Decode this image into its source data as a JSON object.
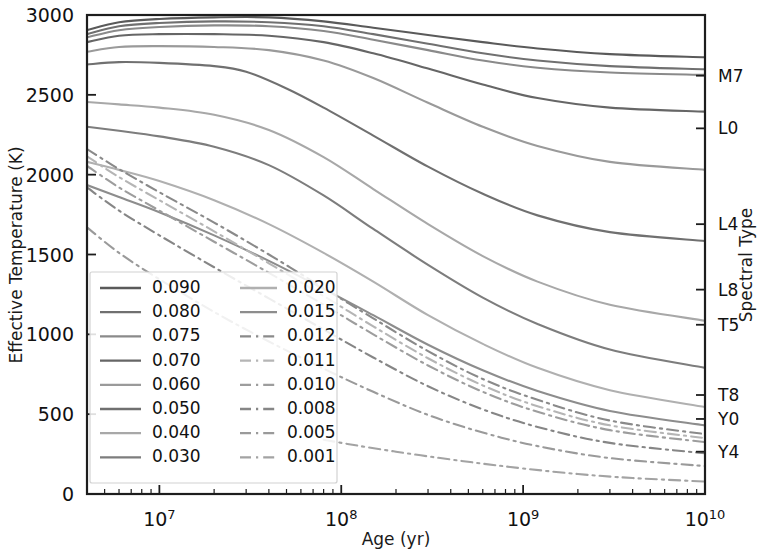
{
  "chart_data": {
    "type": "line",
    "title": "",
    "xlabel": "Age (yr)",
    "ylabel": "Effective Temperature (K)",
    "y2label": "Spectral Type",
    "xscale": "log",
    "xlim": [
      4000000,
      10000000000
    ],
    "ylim": [
      0,
      3000
    ],
    "grid": false,
    "legend_position": "lower-left-inside",
    "legend_title": "",
    "xticks": [
      "10⁷",
      "10⁸",
      "10⁹",
      "10¹⁰"
    ],
    "xtick_values": [
      10000000,
      100000000,
      1000000000,
      10000000000
    ],
    "yticks": [
      "0",
      "500",
      "1000",
      "1500",
      "2000",
      "2500",
      "3000"
    ],
    "ytick_values": [
      0,
      500,
      1000,
      1500,
      2000,
      2500,
      3000
    ],
    "spectral_types": [
      {
        "label": "M7",
        "temperature": 2620
      },
      {
        "label": "L0",
        "temperature": 2290
      },
      {
        "label": "L4",
        "temperature": 1690
      },
      {
        "label": "L8",
        "temperature": 1280
      },
      {
        "label": "T5",
        "temperature": 1060
      },
      {
        "label": "T8",
        "temperature": 620
      },
      {
        "label": "Y0",
        "temperature": 470
      },
      {
        "label": "Y4",
        "temperature": 265
      }
    ],
    "series": [
      {
        "name": "0.090",
        "style": "solid",
        "color": "#5a5a5a",
        "points": [
          [
            4000000.0,
            2905
          ],
          [
            6000000.0,
            2955
          ],
          [
            10000000.0,
            2975
          ],
          [
            20000000.0,
            2985
          ],
          [
            40000000.0,
            2985
          ],
          [
            80000000.0,
            2960
          ],
          [
            150000000.0,
            2920
          ],
          [
            300000000.0,
            2875
          ],
          [
            600000000.0,
            2830
          ],
          [
            1200000000.0,
            2790
          ],
          [
            3000000000.0,
            2755
          ],
          [
            10000000000.0,
            2735
          ]
        ]
      },
      {
        "name": "0.080",
        "style": "solid",
        "color": "#707070",
        "points": [
          [
            4000000.0,
            2880
          ],
          [
            6000000.0,
            2930
          ],
          [
            10000000.0,
            2950
          ],
          [
            20000000.0,
            2960
          ],
          [
            40000000.0,
            2955
          ],
          [
            80000000.0,
            2930
          ],
          [
            150000000.0,
            2880
          ],
          [
            300000000.0,
            2820
          ],
          [
            600000000.0,
            2760
          ],
          [
            1200000000.0,
            2715
          ],
          [
            3000000000.0,
            2680
          ],
          [
            10000000000.0,
            2660
          ]
        ]
      },
      {
        "name": "0.075",
        "style": "solid",
        "color": "#8a8a8a",
        "points": [
          [
            4000000.0,
            2860
          ],
          [
            6000000.0,
            2905
          ],
          [
            10000000.0,
            2925
          ],
          [
            20000000.0,
            2935
          ],
          [
            40000000.0,
            2930
          ],
          [
            80000000.0,
            2900
          ],
          [
            150000000.0,
            2845
          ],
          [
            300000000.0,
            2780
          ],
          [
            600000000.0,
            2715
          ],
          [
            1200000000.0,
            2670
          ],
          [
            3000000000.0,
            2640
          ],
          [
            10000000000.0,
            2625
          ]
        ]
      },
      {
        "name": "0.070",
        "style": "solid",
        "color": "#666666",
        "points": [
          [
            4000000.0,
            2830
          ],
          [
            6000000.0,
            2870
          ],
          [
            10000000.0,
            2880
          ],
          [
            20000000.0,
            2880
          ],
          [
            40000000.0,
            2870
          ],
          [
            80000000.0,
            2830
          ],
          [
            150000000.0,
            2760
          ],
          [
            300000000.0,
            2665
          ],
          [
            600000000.0,
            2565
          ],
          [
            1200000000.0,
            2480
          ],
          [
            3000000000.0,
            2420
          ],
          [
            10000000000.0,
            2395
          ]
        ]
      },
      {
        "name": "0.060",
        "style": "solid",
        "color": "#9a9a9a",
        "points": [
          [
            4000000.0,
            2770
          ],
          [
            6000000.0,
            2800
          ],
          [
            10000000.0,
            2805
          ],
          [
            20000000.0,
            2800
          ],
          [
            40000000.0,
            2780
          ],
          [
            80000000.0,
            2715
          ],
          [
            150000000.0,
            2605
          ],
          [
            300000000.0,
            2450
          ],
          [
            600000000.0,
            2300
          ],
          [
            1200000000.0,
            2180
          ],
          [
            3000000000.0,
            2080
          ],
          [
            10000000000.0,
            2030
          ]
        ]
      },
      {
        "name": "0.050",
        "style": "solid",
        "color": "#707070",
        "points": [
          [
            4000000.0,
            2690
          ],
          [
            6000000.0,
            2705
          ],
          [
            10000000.0,
            2700
          ],
          [
            20000000.0,
            2680
          ],
          [
            30000000.0,
            2645
          ],
          [
            50000000.0,
            2540
          ],
          [
            80000000.0,
            2420
          ],
          [
            150000000.0,
            2245
          ],
          [
            300000000.0,
            2050
          ],
          [
            600000000.0,
            1880
          ],
          [
            1200000000.0,
            1745
          ],
          [
            3000000000.0,
            1640
          ],
          [
            10000000000.0,
            1585
          ]
        ]
      },
      {
        "name": "0.040",
        "style": "solid",
        "color": "#a8a8a8",
        "points": [
          [
            4000000.0,
            2455
          ],
          [
            6000000.0,
            2440
          ],
          [
            10000000.0,
            2420
          ],
          [
            20000000.0,
            2375
          ],
          [
            40000000.0,
            2280
          ],
          [
            80000000.0,
            2110
          ],
          [
            150000000.0,
            1910
          ],
          [
            300000000.0,
            1690
          ],
          [
            600000000.0,
            1490
          ],
          [
            1200000000.0,
            1330
          ],
          [
            3000000000.0,
            1185
          ],
          [
            10000000000.0,
            1085
          ]
        ]
      },
      {
        "name": "0.030",
        "style": "solid",
        "color": "#7d7d7d",
        "points": [
          [
            4000000.0,
            2300
          ],
          [
            6000000.0,
            2275
          ],
          [
            10000000.0,
            2240
          ],
          [
            20000000.0,
            2175
          ],
          [
            40000000.0,
            2060
          ],
          [
            80000000.0,
            1870
          ],
          [
            150000000.0,
            1660
          ],
          [
            300000000.0,
            1435
          ],
          [
            600000000.0,
            1230
          ],
          [
            1200000000.0,
            1065
          ],
          [
            3000000000.0,
            905
          ],
          [
            10000000000.0,
            790
          ]
        ]
      },
      {
        "name": "0.020",
        "style": "solid",
        "color": "#b0b0b0",
        "points": [
          [
            4000000.0,
            2080
          ],
          [
            6000000.0,
            2030
          ],
          [
            10000000.0,
            1960
          ],
          [
            20000000.0,
            1840
          ],
          [
            40000000.0,
            1690
          ],
          [
            80000000.0,
            1510
          ],
          [
            150000000.0,
            1330
          ],
          [
            300000000.0,
            1120
          ],
          [
            600000000.0,
            940
          ],
          [
            1200000000.0,
            790
          ],
          [
            3000000000.0,
            650
          ],
          [
            10000000000.0,
            545
          ]
        ]
      },
      {
        "name": "0.015",
        "style": "solid",
        "color": "#8d8d8d",
        "points": [
          [
            4000000.0,
            1935
          ],
          [
            6000000.0,
            1860
          ],
          [
            10000000.0,
            1765
          ],
          [
            20000000.0,
            1620
          ],
          [
            40000000.0,
            1460
          ],
          [
            80000000.0,
            1285
          ],
          [
            150000000.0,
            1120
          ],
          [
            300000000.0,
            935
          ],
          [
            600000000.0,
            775
          ],
          [
            1200000000.0,
            645
          ],
          [
            3000000000.0,
            520
          ],
          [
            10000000000.0,
            430
          ]
        ]
      },
      {
        "name": "0.012",
        "style": "dashdot",
        "color": "#8a8a8a",
        "points": [
          [
            4000000.0,
            2160
          ],
          [
            6000000.0,
            2035
          ],
          [
            10000000.0,
            1890
          ],
          [
            20000000.0,
            1700
          ],
          [
            40000000.0,
            1500
          ],
          [
            80000000.0,
            1290
          ],
          [
            150000000.0,
            1100
          ],
          [
            300000000.0,
            895
          ],
          [
            600000000.0,
            720
          ],
          [
            1200000000.0,
            590
          ],
          [
            3000000000.0,
            460
          ],
          [
            10000000000.0,
            375
          ]
        ]
      },
      {
        "name": "0.011",
        "style": "dashdot",
        "color": "#b5b5b5",
        "points": [
          [
            4000000.0,
            2115
          ],
          [
            6000000.0,
            1985
          ],
          [
            10000000.0,
            1840
          ],
          [
            20000000.0,
            1645
          ],
          [
            40000000.0,
            1445
          ],
          [
            80000000.0,
            1240
          ],
          [
            150000000.0,
            1050
          ],
          [
            300000000.0,
            850
          ],
          [
            600000000.0,
            680
          ],
          [
            1200000000.0,
            550
          ],
          [
            3000000000.0,
            430
          ],
          [
            10000000000.0,
            350
          ]
        ]
      },
      {
        "name": "0.010",
        "style": "dashdot",
        "color": "#9d9d9d",
        "points": [
          [
            4000000.0,
            2055
          ],
          [
            6000000.0,
            1920
          ],
          [
            10000000.0,
            1775
          ],
          [
            20000000.0,
            1580
          ],
          [
            40000000.0,
            1385
          ],
          [
            80000000.0,
            1185
          ],
          [
            150000000.0,
            1000
          ],
          [
            300000000.0,
            805
          ],
          [
            600000000.0,
            640
          ],
          [
            1200000000.0,
            515
          ],
          [
            3000000000.0,
            400
          ],
          [
            10000000000.0,
            325
          ]
        ]
      },
      {
        "name": "0.008",
        "style": "dashdot",
        "color": "#868686",
        "points": [
          [
            4000000.0,
            1920
          ],
          [
            6000000.0,
            1775
          ],
          [
            10000000.0,
            1620
          ],
          [
            20000000.0,
            1420
          ],
          [
            40000000.0,
            1225
          ],
          [
            80000000.0,
            1030
          ],
          [
            150000000.0,
            855
          ],
          [
            300000000.0,
            675
          ],
          [
            600000000.0,
            530
          ],
          [
            1200000000.0,
            420
          ],
          [
            3000000000.0,
            320
          ],
          [
            10000000000.0,
            255
          ]
        ]
      },
      {
        "name": "0.005",
        "style": "dashdot",
        "color": "#9a9a9a",
        "points": [
          [
            4000000.0,
            1670
          ],
          [
            6000000.0,
            1510
          ],
          [
            10000000.0,
            1345
          ],
          [
            20000000.0,
            1140
          ],
          [
            40000000.0,
            955
          ],
          [
            80000000.0,
            785
          ],
          [
            150000000.0,
            640
          ],
          [
            300000000.0,
            495
          ],
          [
            600000000.0,
            385
          ],
          [
            1200000000.0,
            300
          ],
          [
            3000000000.0,
            225
          ],
          [
            10000000000.0,
            175
          ]
        ]
      },
      {
        "name": "0.001",
        "style": "dashdot",
        "color": "#a3a3a3",
        "points": [
          [
            80000000.0,
            340
          ],
          [
            120000000.0,
            305
          ],
          [
            200000000.0,
            265
          ],
          [
            350000000.0,
            225
          ],
          [
            600000000.0,
            190
          ],
          [
            1000000000.0,
            160
          ],
          [
            2000000000.0,
            125
          ],
          [
            4000000000.0,
            100
          ],
          [
            10000000000.0,
            78
          ]
        ]
      }
    ]
  },
  "legend": {
    "columns": [
      {
        "entries": [
          {
            "label": "0.090",
            "style": "solid",
            "color": "#5a5a5a"
          },
          {
            "label": "0.080",
            "style": "solid",
            "color": "#707070"
          },
          {
            "label": "0.075",
            "style": "solid",
            "color": "#8a8a8a"
          },
          {
            "label": "0.070",
            "style": "solid",
            "color": "#666666"
          },
          {
            "label": "0.060",
            "style": "solid",
            "color": "#9a9a9a"
          },
          {
            "label": "0.050",
            "style": "solid",
            "color": "#707070"
          },
          {
            "label": "0.040",
            "style": "solid",
            "color": "#a8a8a8"
          },
          {
            "label": "0.030",
            "style": "solid",
            "color": "#7d7d7d"
          }
        ]
      },
      {
        "entries": [
          {
            "label": "0.020",
            "style": "solid",
            "color": "#b0b0b0"
          },
          {
            "label": "0.015",
            "style": "solid",
            "color": "#8d8d8d"
          },
          {
            "label": "0.012",
            "style": "dashdot",
            "color": "#8a8a8a"
          },
          {
            "label": "0.011",
            "style": "dashdot",
            "color": "#b5b5b5"
          },
          {
            "label": "0.010",
            "style": "dashdot",
            "color": "#9d9d9d"
          },
          {
            "label": "0.008",
            "style": "dashdot",
            "color": "#868686"
          },
          {
            "label": "0.005",
            "style": "dashdot",
            "color": "#9a9a9a"
          },
          {
            "label": "0.001",
            "style": "dashdot",
            "color": "#a3a3a3"
          }
        ]
      }
    ]
  }
}
